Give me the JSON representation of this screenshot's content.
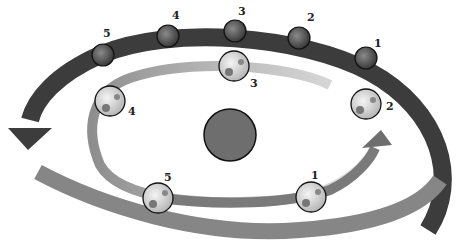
{
  "diagram": {
    "colors": {
      "outer_band": "#3c3c3c",
      "inner_band_light": "#cfcfcf",
      "inner_band_dark": "#7a7a7a",
      "lower_band": "#8a8a8a",
      "sun": "#6e6e6e",
      "outline": "#111111"
    },
    "sun": {
      "label": ""
    },
    "outer_planets": [
      {
        "label": "1"
      },
      {
        "label": "2"
      },
      {
        "label": "3"
      },
      {
        "label": "4"
      },
      {
        "label": "5"
      }
    ],
    "earths": [
      {
        "label": "1"
      },
      {
        "label": "2"
      },
      {
        "label": "3"
      },
      {
        "label": "4"
      },
      {
        "label": "5"
      }
    ]
  }
}
